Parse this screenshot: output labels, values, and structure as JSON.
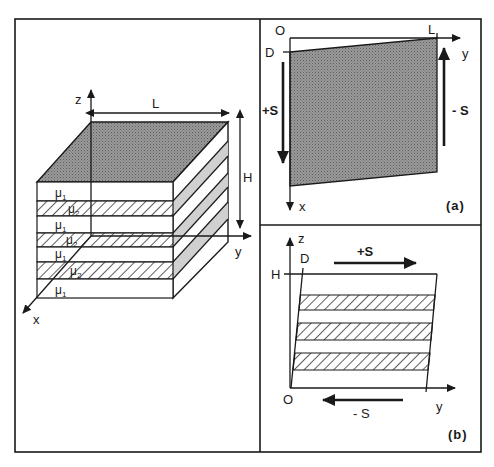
{
  "figure": {
    "left_panel": {
      "axes": {
        "z": "z",
        "y": "y",
        "x": "x"
      },
      "dimensions": {
        "length": "L",
        "height": "H"
      },
      "layers": [
        {
          "label": "μ",
          "sub": "1",
          "type": "plain"
        },
        {
          "label": "μ",
          "sub": "2",
          "type": "hatched"
        },
        {
          "label": "μ",
          "sub": "1",
          "type": "plain"
        },
        {
          "label": "μ",
          "sub": "2",
          "type": "hatched"
        },
        {
          "label": "μ",
          "sub": "1",
          "type": "plain"
        },
        {
          "label": "μ",
          "sub": "2",
          "type": "hatched"
        },
        {
          "label": "μ",
          "sub": "1",
          "type": "plain"
        }
      ]
    },
    "panel_a": {
      "tag": "(a)",
      "origin": "O",
      "d_mark": "D",
      "l_mark": "L",
      "axis_y": "y",
      "axis_x": "x",
      "stress_pos": "+S",
      "stress_neg": "- S"
    },
    "panel_b": {
      "tag": "(b)",
      "origin": "O",
      "d_mark": "D",
      "h_mark": "H",
      "axis_z": "z",
      "axis_y": "y",
      "stress_pos": "+S",
      "stress_neg": "- S"
    },
    "colors": {
      "ink": "#1a1a1a",
      "shade": "#8a8a8a",
      "light_shade": "#cfcfcf",
      "background": "#ffffff"
    }
  }
}
